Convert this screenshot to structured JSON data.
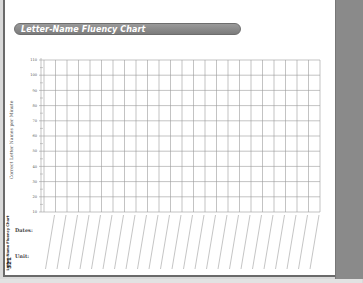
{
  "header": {
    "title": "Letter-Name Fluency Chart"
  },
  "chart_data": {
    "type": "table",
    "title": "Letter-Name Fluency Chart",
    "ylabel": "Correct Letter Names per Minute",
    "xlabel": "",
    "y_ticks": [
      110,
      100,
      90,
      80,
      70,
      60,
      50,
      40,
      30,
      20,
      10
    ],
    "ylim": [
      10,
      110
    ],
    "columns": 24,
    "grid": true,
    "row_labels_below": [
      "Dates:",
      "Unit:"
    ],
    "values": []
  },
  "labels": {
    "y_axis": "Correct Letter Names per Minute",
    "dates": "Dates:",
    "unit": "Unit:"
  },
  "footer": {
    "side_text": "Letter-Name Fluency Chart",
    "page_number": "321"
  },
  "colors": {
    "title_bar": "#8a8a8a",
    "grid_line": "#9a9a9a",
    "side_tab": "#8a8a8a"
  }
}
